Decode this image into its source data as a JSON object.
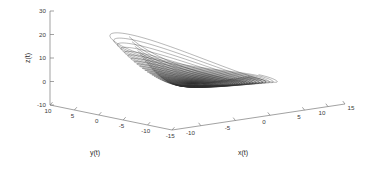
{
  "figure": {
    "background_color": "#ffffff",
    "line_color": "#2f2f2f",
    "axis_color": "#7a7a7a",
    "text_color": "#3a3a3a"
  },
  "chart_data": {
    "type": "line",
    "subtype": "3d-phase-portrait",
    "title": "",
    "subtitle": "",
    "xlabel": "x(t)",
    "ylabel": "y(t)",
    "zlabel": "z(t)",
    "grid": false,
    "legend": null,
    "legend_position": "none",
    "xlim": [
      -12.5,
      16
    ],
    "ylim": [
      -16,
      11
    ],
    "zlim": [
      -10,
      30
    ],
    "xticks": [
      -10,
      -5,
      0,
      5,
      10,
      15
    ],
    "xticklabels": [
      "-10",
      "-5",
      "0",
      "5",
      "10",
      "15"
    ],
    "yticks": [
      10,
      5,
      0,
      -5,
      -10,
      -15
    ],
    "yticklabels": [
      "10",
      "5",
      "0",
      "-5",
      "-10",
      "-15"
    ],
    "zticks": [
      30,
      20,
      10,
      0,
      -10
    ],
    "zticklabels": [
      "30",
      "20",
      "10",
      "0",
      "-10"
    ],
    "series": [
      {
        "name": "trajectory",
        "description": "Chaotic attractor trajectory spiralling outward in the z-low plane then lifting into a funnel/cone reaching z near 25",
        "color": "#2f2f2f",
        "n_revolutions": 46,
        "spiral_center": [
          0.0,
          -1.5
        ],
        "z_base": -2.0,
        "z_peak": 25.0,
        "r_min": 0.35,
        "r_max": 11.5
      }
    ],
    "annotations": []
  },
  "axes": {
    "x_title": "x(t)",
    "y_title": "y(t)",
    "z_title": "z(t)",
    "z_ticks": [
      "30",
      "20",
      "10",
      "0",
      "-10"
    ],
    "y_ticks": [
      "10",
      "5",
      "0",
      "-5",
      "-10",
      "-15"
    ],
    "x_ticks": [
      "-10",
      "-5",
      "0",
      "5",
      "10",
      "15"
    ]
  }
}
